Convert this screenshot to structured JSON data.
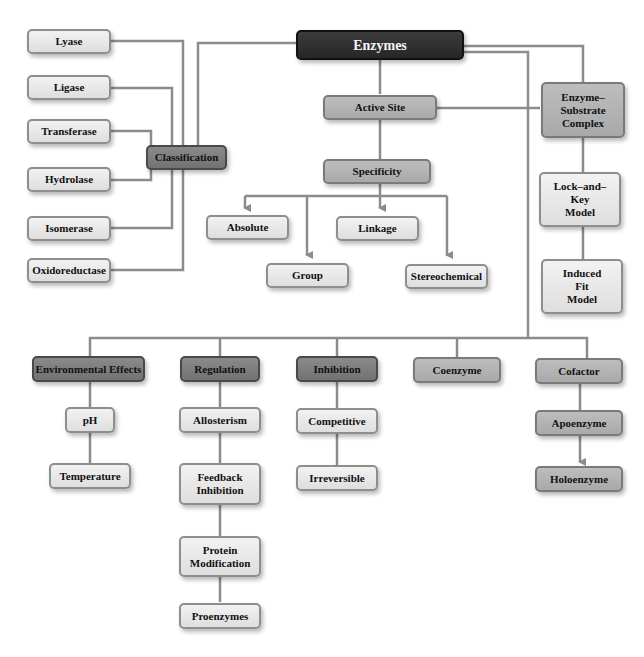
{
  "diagram": {
    "root": "Enzymes",
    "classification": {
      "label": "Classification",
      "children": [
        "Lyase",
        "Ligase",
        "Transferase",
        "Hydrolase",
        "Isomerase",
        "Oxidoreductase"
      ]
    },
    "active_site": {
      "label": "Active Site"
    },
    "specificity": {
      "label": "Specificity",
      "children": [
        "Absolute",
        "Group",
        "Linkage",
        "Stereochemical"
      ]
    },
    "enzyme_substrate_complex": {
      "label": "Enzyme–\nSubstrate\nComplex",
      "models": [
        "Lock–and–\nKey\nModel",
        "Induced\nFit\nModel"
      ]
    },
    "environmental_effects": {
      "label": "Environmental Effects",
      "children": [
        "pH",
        "Temperature"
      ]
    },
    "regulation": {
      "label": "Regulation",
      "children": [
        "Allosterism",
        "Feedback\nInhibition",
        "Protein\nModification",
        "Proenzymes"
      ]
    },
    "inhibition": {
      "label": "Inhibition",
      "children": [
        "Competitive",
        "Irreversible"
      ]
    },
    "coenzyme": {
      "label": "Coenzyme"
    },
    "cofactor": {
      "label": "Cofactor",
      "children": [
        "Apoenzyme",
        "Holoenzyme"
      ]
    }
  },
  "colors": {
    "root": "#2e2e2e",
    "dark": "#7e7e7e",
    "mid": "#b3b3b3",
    "light": "#e6e6e6",
    "connector": "#8c8c8c"
  }
}
